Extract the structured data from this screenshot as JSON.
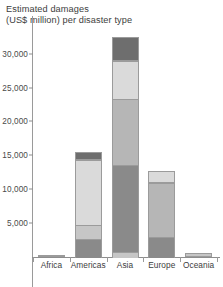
{
  "chart": {
    "title": "Estimated damages (US$ million) per disaster type",
    "title_line1": "Estimated damages",
    "title_line2": "(US$ million) per disaster type"
  },
  "axis": {
    "y_ticks": [
      "5,000",
      "10,000",
      "15,000",
      "20,000",
      "25,000",
      "30,000"
    ],
    "y_tick_values": [
      5000,
      10000,
      15000,
      20000,
      25000,
      30000
    ]
  },
  "chart_data": {
    "type": "bar",
    "subtype": "stacked-bar",
    "title": "Estimated damages (US$ million) per disaster type",
    "xlabel": "",
    "ylabel": "Estimated damages (US$ million)",
    "ylim": [
      0,
      33500
    ],
    "ytick_step": 5000,
    "grid": false,
    "legend": "none",
    "orientation": "vertical",
    "categories": [
      "Africa",
      "Americas",
      "Asia",
      "Europe",
      "Oceania"
    ],
    "series": [
      {
        "name": "segment-1-bottom",
        "color": "#8a8a8a",
        "values": [
          120,
          2750,
          950,
          3050,
          0
        ]
      },
      {
        "name": "segment-2",
        "color": "#c6c6c6",
        "values": [
          0,
          2300,
          13000,
          0,
          600
        ]
      },
      {
        "name": "segment-3",
        "color": "#b6b6b6",
        "values": [
          0,
          0,
          9750,
          8100,
          0
        ]
      },
      {
        "name": "segment-4",
        "color": "#dadada",
        "values": [
          0,
          9700,
          5800,
          1900,
          0
        ]
      },
      {
        "name": "segment-5-top",
        "color": "#6e6e6e",
        "values": [
          0,
          1200,
          3600,
          0,
          0
        ]
      }
    ],
    "totals": [
      120,
      15950,
      33100,
      13050,
      600
    ]
  },
  "bars": [
    {
      "label": "Africa",
      "total": 120,
      "segments": [
        {
          "name": "segment-1-bottom",
          "value": 120,
          "color": "#8a8a8a"
        }
      ]
    },
    {
      "label": "Americas",
      "total": 15950,
      "segments": [
        {
          "name": "segment-1-bottom",
          "value": 2750,
          "color": "#8a8a8a"
        },
        {
          "name": "segment-2",
          "value": 2300,
          "color": "#c6c6c6"
        },
        {
          "name": "segment-4",
          "value": 9700,
          "color": "#dadada"
        },
        {
          "name": "segment-5-top",
          "value": 1200,
          "color": "#6e6e6e"
        }
      ]
    },
    {
      "label": "Asia",
      "total": 33100,
      "segments": [
        {
          "name": "segment-2",
          "value": 950,
          "color": "#c6c6c6"
        },
        {
          "name": "segment-1-bottom",
          "value": 13000,
          "color": "#8a8a8a"
        },
        {
          "name": "segment-3",
          "value": 9750,
          "color": "#b6b6b6"
        },
        {
          "name": "segment-4",
          "value": 5800,
          "color": "#dadada"
        },
        {
          "name": "segment-5-top",
          "value": 3600,
          "color": "#6e6e6e"
        }
      ]
    },
    {
      "label": "Europe",
      "total": 13050,
      "segments": [
        {
          "name": "segment-1-bottom",
          "value": 3050,
          "color": "#8a8a8a"
        },
        {
          "name": "segment-3",
          "value": 8100,
          "color": "#b6b6b6"
        },
        {
          "name": "segment-4",
          "value": 1900,
          "color": "#dadada"
        }
      ]
    },
    {
      "label": "Oceania",
      "total": 600,
      "segments": [
        {
          "name": "segment-2",
          "value": 600,
          "color": "#c6c6c6"
        }
      ]
    }
  ],
  "colors": {
    "axis": "#8d8d8d",
    "text": "#3d3d3d",
    "segment_border": "#9b9b9b"
  }
}
